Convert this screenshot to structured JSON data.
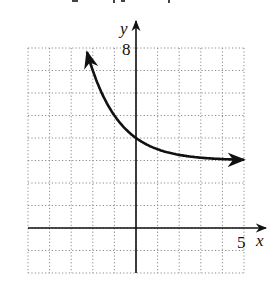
{
  "chart_data": {
    "type": "line",
    "title": "",
    "xlabel": "x",
    "ylabel": "y",
    "xlim": [
      -5,
      5
    ],
    "ylim": [
      -2,
      8
    ],
    "grid": true,
    "grid_style": "dotted",
    "tick_labels": {
      "x": [
        "5"
      ],
      "y": [
        "8"
      ]
    },
    "tick_label_positions": {
      "x": [
        5
      ],
      "y": [
        8
      ]
    },
    "series": [
      {
        "name": "f(x)",
        "description": "decreasing exponential with horizontal asymptote y = 3, y-intercept (0, 4), arrows at both ends",
        "x": [
          -2.27,
          -2,
          -1,
          0,
          1,
          2,
          3,
          4,
          5
        ],
        "values": [
          7.82,
          7.0,
          5.0,
          4.0,
          3.5,
          3.25,
          3.125,
          3.06,
          3.03
        ]
      }
    ],
    "colors": {
      "curve": "#111111",
      "axes": "#111111",
      "grid": "#8a8a8a"
    }
  }
}
